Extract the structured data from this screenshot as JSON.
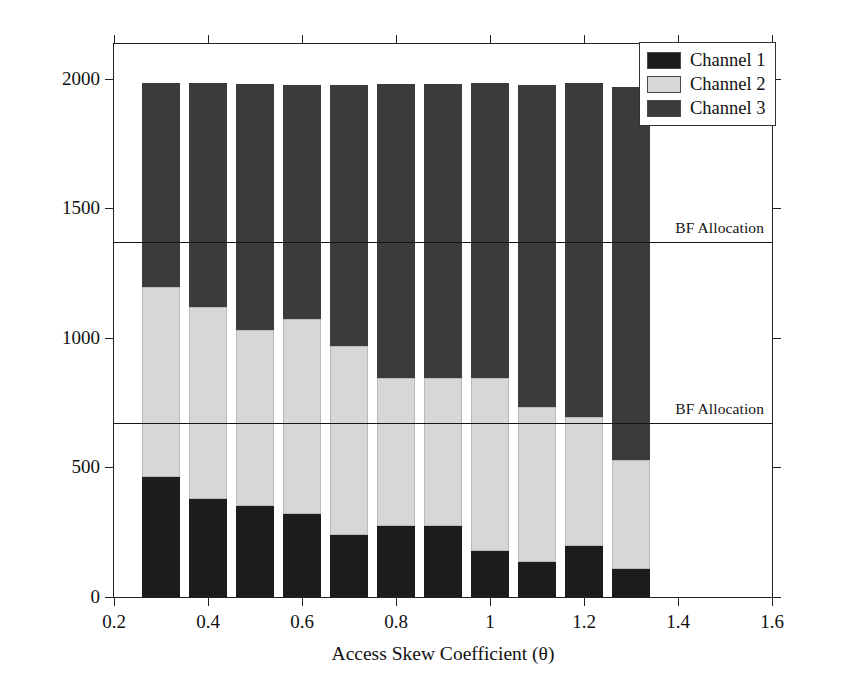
{
  "chart_data": {
    "type": "bar",
    "stacked": true,
    "title": "",
    "xlabel": "Access Skew Coefficient (θ)",
    "ylabel": "Total Number of Items (D)",
    "xlim": [
      0.2,
      1.6
    ],
    "ylim": [
      0,
      2135
    ],
    "grid": false,
    "legend_position": "top-right",
    "xticks": [
      "0.2",
      "0.4",
      "0.6",
      "0.8",
      "1",
      "1.2",
      "1.4",
      "1.6"
    ],
    "xtick_values": [
      0.2,
      0.4,
      0.6,
      0.8,
      1.0,
      1.2,
      1.4,
      1.6
    ],
    "yticks": [
      "0",
      "500",
      "1000",
      "1500",
      "2000"
    ],
    "ytick_values": [
      0,
      500,
      1000,
      1500,
      2000
    ],
    "categories": [
      0.3,
      0.4,
      0.5,
      0.6,
      0.7,
      0.8,
      0.9,
      1.0,
      1.1,
      1.2,
      1.3
    ],
    "series": [
      {
        "name": "Channel 1",
        "color": "#1c1c1c",
        "values": [
          462,
          380,
          352,
          320,
          238,
          275,
          276,
          178,
          135,
          196,
          110
        ]
      },
      {
        "name": "Channel 2",
        "color": "#d7d7d7",
        "values": [
          735,
          740,
          678,
          755,
          732,
          572,
          571,
          666,
          600,
          500,
          420
        ]
      },
      {
        "name": "Channel 3",
        "color": "#3b3b3b",
        "values": [
          788,
          865,
          950,
          900,
          1005,
          1135,
          1133,
          1141,
          1240,
          1290,
          1440
        ]
      }
    ],
    "totals": [
      1985,
      1985,
      1980,
      1975,
      1975,
      1982,
      1980,
      1985,
      1975,
      1986,
      1970
    ],
    "reference_lines": [
      {
        "label": "BF Allocation",
        "value": 1367
      },
      {
        "label": "BF Allocation",
        "value": 667
      }
    ]
  },
  "legend": {
    "items": [
      {
        "label": "Channel 1",
        "color": "#1c1c1c"
      },
      {
        "label": "Channel 2",
        "color": "#d7d7d7"
      },
      {
        "label": "Channel 3",
        "color": "#3b3b3b"
      }
    ]
  }
}
